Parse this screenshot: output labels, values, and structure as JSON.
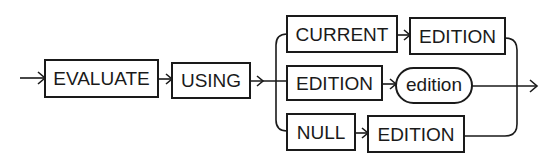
{
  "diagram": {
    "type": "railroad-syntax-diagram",
    "colors": {
      "stroke": "#1a1a1a",
      "background": "#ffffff"
    },
    "sequence": [
      {
        "kind": "keyword",
        "label": "EVALUATE"
      },
      {
        "kind": "keyword",
        "label": "USING"
      }
    ],
    "choices": [
      {
        "items": [
          {
            "kind": "keyword",
            "label": "CURRENT"
          },
          {
            "kind": "keyword",
            "label": "EDITION"
          }
        ]
      },
      {
        "items": [
          {
            "kind": "keyword",
            "label": "EDITION"
          },
          {
            "kind": "variable",
            "label": "edition"
          }
        ]
      },
      {
        "items": [
          {
            "kind": "keyword",
            "label": "NULL"
          },
          {
            "kind": "keyword",
            "label": "EDITION"
          }
        ]
      }
    ]
  }
}
